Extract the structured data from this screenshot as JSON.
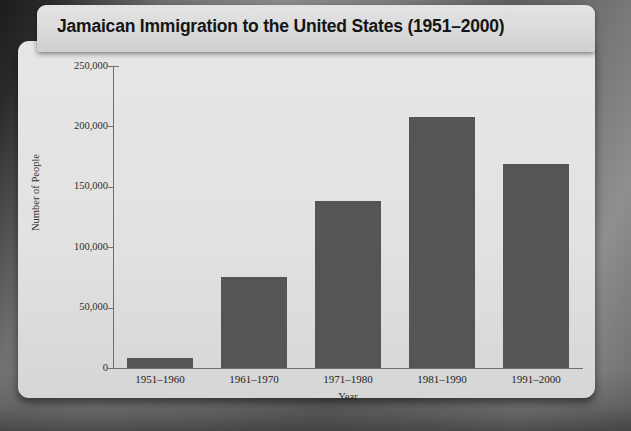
{
  "chart_data": {
    "type": "bar",
    "title": "Jamaican Immigration to the United States (1951–2000)",
    "xlabel": "Year",
    "ylabel": "Number of People",
    "categories": [
      "1951–1960",
      "1961–1970",
      "1971–1980",
      "1981–1990",
      "1991–2000"
    ],
    "values": [
      8500,
      75000,
      138000,
      208000,
      169000
    ],
    "ylim": [
      0,
      250000
    ],
    "ytick_values": [
      0,
      50000,
      100000,
      150000,
      200000,
      250000
    ],
    "ytick_labels": [
      "0",
      "50,000",
      "100,000",
      "150,000",
      "200,000",
      "250,000"
    ],
    "grid": false,
    "legend": null,
    "bar_color": "#555555",
    "plot_background": "#e2e2e2"
  },
  "colors": {
    "bar": "#555555",
    "axis": "#6f6f6f",
    "card": "#e2e2e2",
    "title_plate": "#dcdcdc",
    "text": "#232323",
    "backdrop": "#6b6b6b"
  }
}
